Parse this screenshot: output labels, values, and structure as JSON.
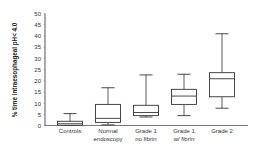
{
  "chart_data": {
    "type": "box",
    "title": "",
    "xlabel": "",
    "ylabel": "% time intraesophageal pH< 4.0",
    "ylim": [
      0,
      50
    ],
    "yticks": [
      0,
      5,
      10,
      15,
      20,
      25,
      30,
      35,
      40,
      45,
      50
    ],
    "grid": false,
    "categories": [
      [
        "Controls"
      ],
      [
        "Normal",
        "endoscopy"
      ],
      [
        "Grade 1",
        "no fibrin"
      ],
      [
        "Grade 1",
        "w/ fibrin"
      ],
      [
        "Grade 2"
      ]
    ],
    "series": [
      {
        "name": "Controls",
        "min": 0.3,
        "q1": 0.3,
        "median": 1.0,
        "q3": 2.1,
        "max": 5.5
      },
      {
        "name": "Normal endoscopy",
        "min": 0.5,
        "q1": 1.6,
        "median": 3.4,
        "q3": 9.6,
        "max": 17.0
      },
      {
        "name": "Grade 1 no fibrin",
        "min": 4.0,
        "q1": 4.6,
        "median": 6.0,
        "q3": 9.2,
        "max": 22.7
      },
      {
        "name": "Grade 1 w/ fibrin",
        "min": 4.6,
        "q1": 9.6,
        "median": 13.3,
        "q3": 16.3,
        "max": 23.0
      },
      {
        "name": "Grade 2",
        "min": 7.9,
        "q1": 13.0,
        "median": 21.0,
        "q3": 23.7,
        "max": 41.0
      }
    ]
  }
}
